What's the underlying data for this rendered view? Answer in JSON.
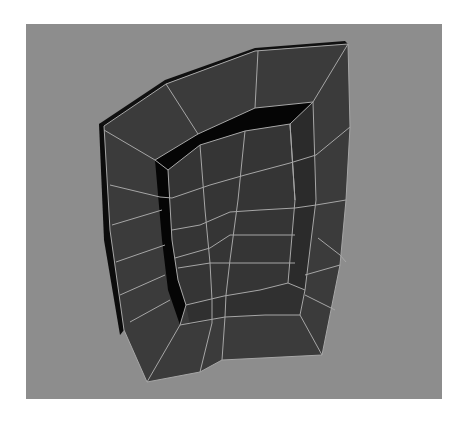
{
  "viewport": {
    "label": "3D perspective viewport",
    "background_color": "#8d8d8d",
    "page_background": "#ffffff"
  },
  "mesh": {
    "name": "polygon-mesh-with-inset-extrusion",
    "face_color": "#3b3b3b",
    "side_color": "#0c0c0c",
    "well_wall_color": "#050505",
    "edge_color": "#a6a6a6"
  },
  "cursor": {
    "type": "arrow-cursor",
    "x": 280,
    "y": 86
  }
}
